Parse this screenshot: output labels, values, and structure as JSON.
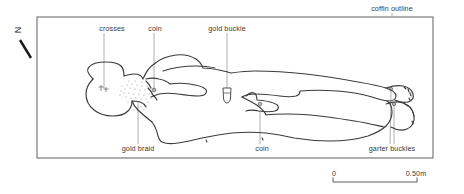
{
  "figure": {
    "type": "archaeological-burial-plan",
    "width": 464,
    "height": 194,
    "background_color": "#ffffff",
    "line_color": "#3c3c3c",
    "coffin": {
      "label": "coffin outline",
      "x": 37,
      "y": 17,
      "width": 396,
      "height": 141,
      "stroke": "#6a6a6a"
    }
  },
  "north_arrow": {
    "letter": "N",
    "name": "north-arrow"
  },
  "labels": {
    "coffin_outline": "coffin outline",
    "crosses": "crosses",
    "coin_upper": "coin",
    "gold_buckle": "gold buckle",
    "gold_braid": "gold braid",
    "coin_lower": "coin",
    "garter_buckles": "garter buckles"
  },
  "scale_bar": {
    "min_label": "0",
    "max_label": "0.50m",
    "x_start": 333,
    "x_end": 417,
    "y": 182
  },
  "finds": [
    {
      "name": "crosses",
      "label": "crosses",
      "marker_x": 104,
      "marker_y": 88,
      "label_x": 112,
      "label_y": 30
    },
    {
      "name": "coin-upper",
      "label": "coin",
      "marker_x": 154,
      "marker_y": 90,
      "label_x": 155,
      "label_y": 30
    },
    {
      "name": "gold-buckle",
      "label": "gold buckle",
      "marker_x": 227,
      "marker_y": 97,
      "label_x": 227,
      "label_y": 30
    },
    {
      "name": "gold-braid",
      "label": "gold braid",
      "marker_x": 138,
      "marker_y": 105,
      "label_x": 138,
      "label_y": 150
    },
    {
      "name": "coin-lower",
      "label": "coin",
      "marker_x": 260,
      "marker_y": 110,
      "label_x": 262,
      "label_y": 150
    },
    {
      "name": "garter-buckles",
      "label": "garter buckles",
      "marker_x": 393,
      "marker_y": 90,
      "label_x": 392,
      "label_y": 150
    }
  ]
}
